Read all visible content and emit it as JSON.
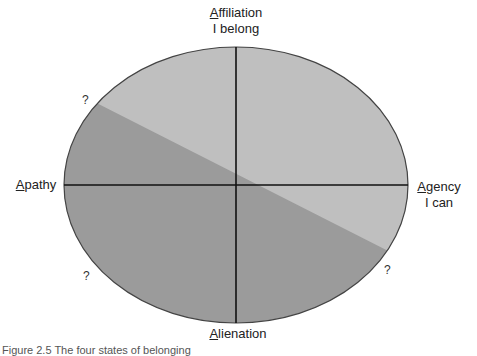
{
  "diagram": {
    "type": "quadrant-ellipse",
    "colors": {
      "light_region": "#bfbfbf",
      "dark_region": "#9b9b9b",
      "outline": "#333333",
      "axes": "#111111"
    },
    "top": {
      "initial": "A",
      "rest": "ffiliation",
      "subtitle": "I belong"
    },
    "right": {
      "initial": "A",
      "rest": "gency",
      "subtitle": "I can"
    },
    "bottom": {
      "initial": "A",
      "rest": "lienation"
    },
    "left": {
      "initial": "A",
      "rest": "pathy"
    },
    "question_marks": [
      "?",
      "?",
      "?"
    ],
    "caption": "Figure 2.5   The four states of belonging"
  }
}
